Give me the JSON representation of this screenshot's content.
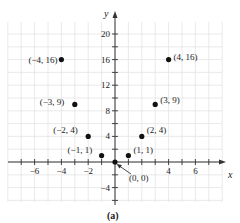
{
  "chart_data": {
    "type": "scatter",
    "title": "",
    "caption": "(a)",
    "xlabel": "x",
    "ylabel": "y",
    "xlim": [
      -8,
      8
    ],
    "ylim": [
      -6,
      22
    ],
    "grid": true,
    "x_ticks": [
      -6,
      -4,
      -2,
      2,
      4,
      6
    ],
    "x_tick_labels": [
      "−6",
      "−4",
      "−2",
      "4",
      "6"
    ],
    "y_ticks": [
      -4,
      4,
      8,
      12,
      16,
      20
    ],
    "y_tick_labels": [
      "−4",
      "4",
      "8",
      "12",
      "16",
      "20"
    ],
    "series": [
      {
        "name": "y = x^2",
        "points": [
          {
            "x": -4,
            "y": 16,
            "label": "(−4, 16)"
          },
          {
            "x": -3,
            "y": 9,
            "label": "(−3, 9)"
          },
          {
            "x": -2,
            "y": 4,
            "label": "(−2, 4)"
          },
          {
            "x": -1,
            "y": 1,
            "label": "(−1, 1)"
          },
          {
            "x": 0,
            "y": 0,
            "label": "(0, 0)"
          },
          {
            "x": 1,
            "y": 1,
            "label": "(1, 1)"
          },
          {
            "x": 2,
            "y": 4,
            "label": "(2, 4)"
          },
          {
            "x": 3,
            "y": 9,
            "label": "(3, 9)"
          },
          {
            "x": 4,
            "y": 16,
            "label": "(4, 16)"
          }
        ]
      }
    ],
    "colors": {
      "points": "#111111",
      "axes": "#333333",
      "grid": "#e4e4e4"
    }
  }
}
